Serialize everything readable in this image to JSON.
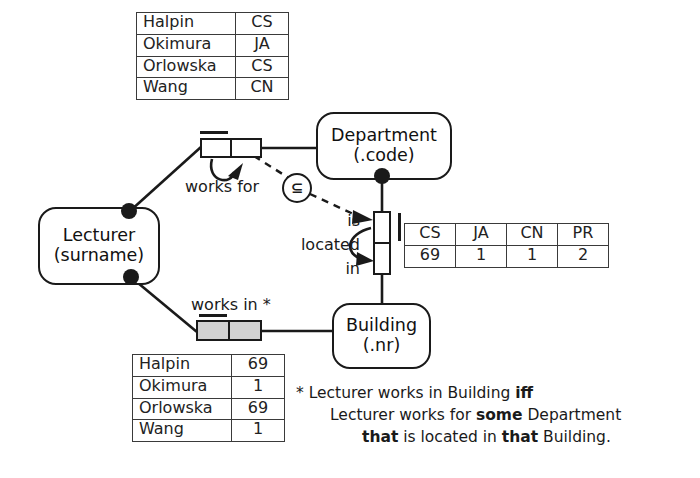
{
  "entities": {
    "lecturer": {
      "name": "Lecturer",
      "ref": "(surname)"
    },
    "department": {
      "name": "Department",
      "ref": "(.code)"
    },
    "building": {
      "name": "Building",
      "ref": "(.nr)"
    }
  },
  "predicates": {
    "works_for": {
      "label": "works for"
    },
    "is_located_in": {
      "line1": "is",
      "line2": "located",
      "line3": "in"
    },
    "works_in": {
      "label": "works in *"
    }
  },
  "constraints": {
    "subset": {
      "symbol": "⊆",
      "name": "subset-constraint"
    }
  },
  "tables": {
    "lecturer_department": {
      "name": "works-for-population",
      "rows": [
        {
          "name": "Halpin",
          "value": "CS"
        },
        {
          "name": "Okimura",
          "value": "JA"
        },
        {
          "name": "Orlowska",
          "value": "CS"
        },
        {
          "name": "Wang",
          "value": "CN"
        }
      ]
    },
    "department_building": {
      "name": "is-located-in-population",
      "headers": [
        "CS",
        "JA",
        "CN",
        "PR"
      ],
      "values": [
        "69",
        "1",
        "1",
        "2"
      ]
    },
    "lecturer_building": {
      "name": "works-in-population",
      "rows": [
        {
          "name": "Halpin",
          "value": "69"
        },
        {
          "name": "Okimura",
          "value": "1"
        },
        {
          "name": "Orlowska",
          "value": "69"
        },
        {
          "name": "Wang",
          "value": "1"
        }
      ]
    }
  },
  "footnote": {
    "line1_prefix": "* Lecturer works in Building ",
    "line1_bold": "iff",
    "line2_prefix": "Lecturer works for ",
    "line2_bold": "some",
    "line2_suffix": " Department",
    "line3_bold_a": "that",
    "line3_mid": " is located in ",
    "line3_bold_b": "that",
    "line3_suffix": " Building."
  },
  "colors": {
    "stroke": "#1a1a1a",
    "derived_fill": "#d2d2d2",
    "background": "#ffffff"
  }
}
